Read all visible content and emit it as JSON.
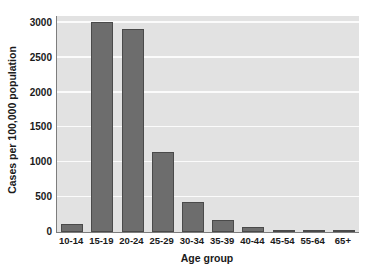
{
  "chart_data": {
    "type": "bar",
    "title": "",
    "xlabel": "Age group",
    "ylabel": "Cases per 100,000 population",
    "categories": [
      "10-14",
      "15-19",
      "20-24",
      "25-29",
      "30-34",
      "35-39",
      "40-44",
      "45-54",
      "55-64",
      "65+"
    ],
    "values": [
      110,
      3010,
      2920,
      1150,
      430,
      170,
      70,
      28,
      10,
      3
    ],
    "ylim": [
      0,
      3100
    ],
    "yticks": [
      0,
      500,
      1000,
      1500,
      2000,
      2500,
      3000
    ],
    "ytick_labels": [
      "0",
      "500",
      "1000",
      "1500",
      "2000",
      "2500",
      "3000"
    ],
    "grid": "horizontal-only",
    "legend": "none",
    "colors": {
      "bar_fill": "#6d6d6d",
      "bar_edge": "#4a4a4a",
      "plot_background": "#e2e2e2",
      "gridline": "#fbfbfb",
      "axis_line": "#7d7d7d",
      "text": "#1a1a1a",
      "figure_background": "#ffffff"
    }
  }
}
